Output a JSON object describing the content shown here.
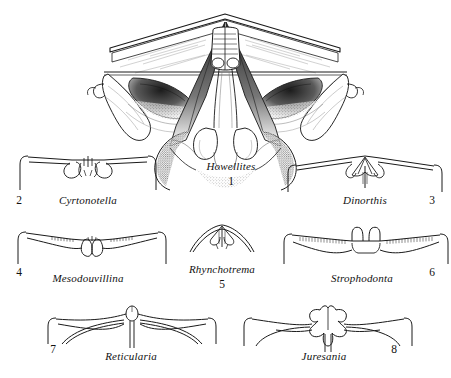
{
  "plate": {
    "background_color": "#ffffff",
    "ink_color": "#1a1a1a",
    "width": 451,
    "height": 378,
    "description": "Line-drawing plate of brachiopod cardinalia / hinge structures, eight numbered genera"
  },
  "figures": [
    {
      "number": "1",
      "genus": "Howellites",
      "icon": "brachiopod-cardinalia-howellites",
      "label_x": 231,
      "label_y": 166,
      "num_x": 231,
      "num_y": 182,
      "detail": "large shaded interior view with cardinal process, brachiophores, stippled muscle field"
    },
    {
      "number": "2",
      "genus": "Cyrtonotella",
      "icon": "brachiopod-hinge-cyrtonotella",
      "label_x": 88,
      "label_y": 200,
      "num_x": 19,
      "num_y": 200,
      "detail": "straight hinge line with curled hooked socket plates"
    },
    {
      "number": "3",
      "genus": "Dinorthis",
      "icon": "brachiopod-hinge-dinorthis",
      "label_x": 365,
      "label_y": 200,
      "num_x": 432,
      "num_y": 200,
      "detail": "fan shaped cardinalia with vertical median septum"
    },
    {
      "number": "4",
      "genus": "Mesodouvillina",
      "icon": "brachiopod-hinge-mesodouvillina",
      "label_x": 88,
      "label_y": 279,
      "num_x": 19,
      "num_y": 272,
      "detail": "denticulate hinge line with paired lobes"
    },
    {
      "number": "5",
      "genus": "Rhynchotrema",
      "icon": "brachiopod-hinge-rhynchotrema",
      "label_x": 222,
      "label_y": 270,
      "num_x": 222,
      "num_y": 285,
      "detail": "small arched shell with narrow cardinal process"
    },
    {
      "number": "6",
      "genus": "Strophodonta",
      "icon": "brachiopod-hinge-strophodonta",
      "label_x": 362,
      "label_y": 279,
      "num_x": 432,
      "num_y": 272,
      "detail": "long denticulate hinge with bilobed cardinal process"
    },
    {
      "number": "7",
      "genus": "Reticularia",
      "icon": "brachiopod-hinge-reticularia",
      "label_x": 131,
      "label_y": 356,
      "num_x": 53,
      "num_y": 349,
      "detail": "swept wing hinge with small rounded cardinal process"
    },
    {
      "number": "8",
      "genus": "Juresania",
      "icon": "brachiopod-hinge-juresania",
      "label_x": 324,
      "label_y": 356,
      "num_x": 394,
      "num_y": 349,
      "detail": "butterfly shaped trilobed cardinal process"
    }
  ]
}
